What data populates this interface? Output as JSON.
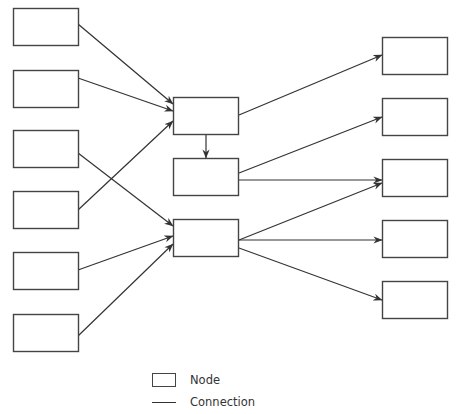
{
  "diagram": {
    "type": "flow-network",
    "stroke_color": "#333333",
    "box_size": {
      "w": 65,
      "h": 37
    },
    "nodes": [
      {
        "id": "L1",
        "x": 13,
        "y": 8
      },
      {
        "id": "L2",
        "x": 13,
        "y": 70
      },
      {
        "id": "L3",
        "x": 13,
        "y": 130
      },
      {
        "id": "L4",
        "x": 13,
        "y": 191
      },
      {
        "id": "L5",
        "x": 13,
        "y": 252
      },
      {
        "id": "L6",
        "x": 13,
        "y": 314
      },
      {
        "id": "M1",
        "x": 173,
        "y": 97
      },
      {
        "id": "M2",
        "x": 173,
        "y": 158
      },
      {
        "id": "M3",
        "x": 173,
        "y": 219
      },
      {
        "id": "R1",
        "x": 382,
        "y": 37
      },
      {
        "id": "R2",
        "x": 382,
        "y": 98
      },
      {
        "id": "R3",
        "x": 382,
        "y": 159
      },
      {
        "id": "R4",
        "x": 382,
        "y": 220
      },
      {
        "id": "R5",
        "x": 382,
        "y": 281
      }
    ],
    "edges": [
      {
        "from": [
          78,
          24
        ],
        "to": [
          173,
          104
        ]
      },
      {
        "from": [
          78,
          78
        ],
        "to": [
          173,
          111
        ]
      },
      {
        "from": [
          78,
          210
        ],
        "to": [
          173,
          121
        ]
      },
      {
        "from": [
          78,
          153
        ],
        "to": [
          173,
          226
        ]
      },
      {
        "from": [
          78,
          270
        ],
        "to": [
          173,
          236
        ]
      },
      {
        "from": [
          78,
          336
        ],
        "to": [
          173,
          244
        ]
      },
      {
        "from": [
          206,
          134
        ],
        "to": [
          206,
          158
        ]
      },
      {
        "from": [
          239,
          115
        ],
        "to": [
          382,
          55
        ]
      },
      {
        "from": [
          239,
          173
        ],
        "to": [
          382,
          117
        ]
      },
      {
        "from": [
          239,
          180
        ],
        "to": [
          382,
          180
        ]
      },
      {
        "from": [
          239,
          240
        ],
        "to": [
          382,
          183
        ]
      },
      {
        "from": [
          239,
          240
        ],
        "to": [
          382,
          240
        ]
      },
      {
        "from": [
          239,
          248
        ],
        "to": [
          382,
          300
        ]
      }
    ]
  },
  "legend": {
    "items": [
      {
        "symbol": "box",
        "label": "Node"
      },
      {
        "symbol": "line",
        "label": "Connection"
      }
    ]
  }
}
